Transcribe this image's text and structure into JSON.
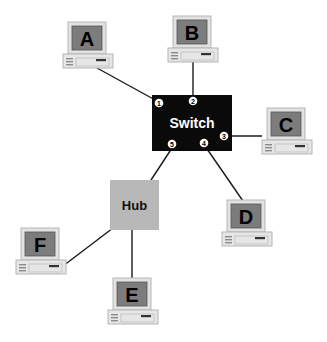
{
  "diagram": {
    "type": "network-topology",
    "switch": {
      "label": "Switch",
      "x": 152,
      "y": 95,
      "w": 80,
      "h": 56,
      "color": "#0a0a0a",
      "ports": [
        {
          "id": "1",
          "x": 159,
          "y": 103
        },
        {
          "id": "2",
          "x": 193,
          "y": 101
        },
        {
          "id": "3",
          "x": 224,
          "y": 136
        },
        {
          "id": "4",
          "x": 204,
          "y": 143
        },
        {
          "id": "5",
          "x": 172,
          "y": 144
        }
      ]
    },
    "hub": {
      "label": "Hub",
      "x": 110,
      "y": 180,
      "w": 49,
      "h": 50,
      "color": "#b8b8b8"
    },
    "computers": [
      {
        "id": "A",
        "label": "A",
        "x": 63,
        "y": 22
      },
      {
        "id": "B",
        "label": "B",
        "x": 168,
        "y": 16
      },
      {
        "id": "C",
        "label": "C",
        "x": 262,
        "y": 108
      },
      {
        "id": "D",
        "label": "D",
        "x": 222,
        "y": 200
      },
      {
        "id": "F",
        "label": "F",
        "x": 16,
        "y": 228
      },
      {
        "id": "E",
        "label": "E",
        "x": 108,
        "y": 278
      }
    ],
    "links": [
      {
        "from": "A",
        "to": "switch-port-1",
        "x1": 97,
        "y1": 68,
        "x2": 157,
        "y2": 101
      },
      {
        "from": "B",
        "to": "switch-port-2",
        "x1": 193,
        "y1": 62,
        "x2": 193,
        "y2": 97
      },
      {
        "from": "C",
        "to": "switch-port-3",
        "x1": 262,
        "y1": 136,
        "x2": 228,
        "y2": 136
      },
      {
        "from": "D",
        "to": "switch-port-4",
        "x1": 243,
        "y1": 201,
        "x2": 205,
        "y2": 146
      },
      {
        "from": "hub",
        "to": "switch-port-5",
        "x1": 151,
        "y1": 180,
        "x2": 172,
        "y2": 148
      },
      {
        "from": "F",
        "to": "hub",
        "x1": 63,
        "y1": 266,
        "x2": 113,
        "y2": 228
      },
      {
        "from": "E",
        "to": "hub",
        "x1": 132,
        "y1": 278,
        "x2": 132,
        "y2": 230
      }
    ]
  }
}
